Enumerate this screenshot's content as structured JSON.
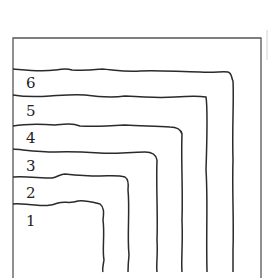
{
  "figure": {
    "colors": {
      "ink": "#2a2a2a",
      "frame": "#555555",
      "background": "#ffffff"
    },
    "frame": {
      "left": 13,
      "top": 38,
      "right": 261,
      "bottom": 278
    },
    "contours": [
      {
        "label": "1",
        "y": 204,
        "x": 104,
        "label_y": 226
      },
      {
        "label": "2",
        "y": 178,
        "x": 129,
        "label_y": 198
      },
      {
        "label": "3",
        "y": 151,
        "x": 157,
        "label_y": 171
      },
      {
        "label": "4",
        "y": 125,
        "x": 182,
        "label_y": 143
      },
      {
        "label": "5",
        "y": 96,
        "x": 207,
        "label_y": 116
      },
      {
        "label": "6",
        "y": 70,
        "x": 233,
        "label_y": 88
      }
    ]
  }
}
